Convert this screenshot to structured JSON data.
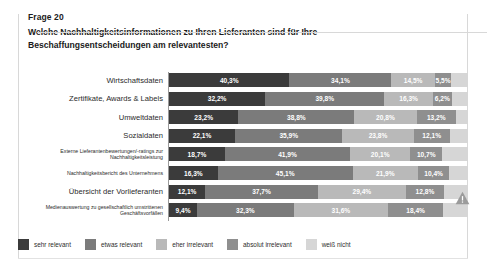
{
  "header": {
    "question_number": "Frage 20",
    "question_text": "Welche Nachhaltigkeitsinformationen zu Ihren Lieferanten sind für Ihre Beschaffungsentscheidungen am relevantesten?"
  },
  "icons": {
    "warning": "warning-triangle-icon"
  },
  "colors": {
    "sehr_relevant": "#3b3b3b",
    "etwas_relevant": "#7b7b7b",
    "eher_irrelevant": "#b9b9b9",
    "absolut_irrelevant": "#8f8f8f",
    "weiss_nicht": "#d6d6d6",
    "axis": "#9a9a9a",
    "border": "#d8d8d8"
  },
  "chart_data": {
    "type": "bar",
    "subtype": "stacked-horizontal-100",
    "title": "Welche Nachhaltigkeitsinformationen zu Ihren Lieferanten sind für Ihre Beschaffungsentscheidungen am relevantesten?",
    "xlabel": "",
    "ylabel": "",
    "xlim": [
      0,
      100
    ],
    "grid": false,
    "legend_position": "bottom",
    "legend": [
      "sehr relevant",
      "etwas relevant",
      "eher irrelevant",
      "absolut irrelevant",
      "weiß nicht"
    ],
    "categories": [
      "Wirtschaftsdaten",
      "Zertifikate, Awards & Labels",
      "Umweltdaten",
      "Sozialdaten",
      "Externe Lieferantenbewertungen/-ratings zur Nachhaltigkeitsleistung",
      "Nachhaltigkeitsbericht des Unternehmens",
      "Übersicht der Vorlieferanten",
      "Medienauswertung zu gesellschaftlich umstrittenen Geschäftsvorfällen"
    ],
    "series": [
      {
        "name": "sehr relevant",
        "values": [
          40.3,
          32.2,
          23.2,
          22.1,
          18.7,
          16.3,
          12.1,
          9.4
        ]
      },
      {
        "name": "etwas relevant",
        "values": [
          34.1,
          39.8,
          38.8,
          35.9,
          41.9,
          45.1,
          37.7,
          32.3
        ]
      },
      {
        "name": "eher irrelevant",
        "values": [
          14.5,
          16.3,
          20.8,
          23.8,
          20.1,
          21.9,
          29.4,
          31.6
        ]
      },
      {
        "name": "absolut irrelevant",
        "values": [
          5.5,
          6.2,
          13.2,
          12.1,
          10.7,
          10.4,
          12.8,
          18.4
        ]
      },
      {
        "name": "weiß nicht",
        "values": [
          5.6,
          5.5,
          4.0,
          6.1,
          8.6,
          6.3,
          8.0,
          8.3
        ]
      }
    ],
    "value_labels": [
      [
        "40,3%",
        "34,1%",
        "14,5%",
        "5,5%",
        ""
      ],
      [
        "32,2%",
        "39,8%",
        "16,3%",
        "6,2%",
        ""
      ],
      [
        "23,2%",
        "38,8%",
        "20,8%",
        "13,2%",
        ""
      ],
      [
        "22,1%",
        "35,9%",
        "23,8%",
        "12,1%",
        ""
      ],
      [
        "18,7%",
        "41,9%",
        "20,1%",
        "10,7%",
        ""
      ],
      [
        "16,3%",
        "45,1%",
        "21,9%",
        "10,4%",
        ""
      ],
      [
        "12,1%",
        "37,7%",
        "29,4%",
        "12,8%",
        ""
      ],
      [
        "9,4%",
        "32,3%",
        "31,6%",
        "18,4%",
        ""
      ]
    ],
    "annotations": [
      {
        "row": "Übersicht der Vorlieferanten",
        "icon": "warning-triangle-icon"
      }
    ]
  },
  "rows": [
    {
      "label": "Wirtschaftsdaten",
      "size": "big"
    },
    {
      "label": "Zertifikate, Awards & Labels",
      "size": "big"
    },
    {
      "label": "Umweltdaten",
      "size": "big"
    },
    {
      "label": "Sozialdaten",
      "size": "big"
    },
    {
      "label": "Externe Lieferantenbewertungen/-ratings zur Nachhaltigkeitsleistung",
      "size": "small"
    },
    {
      "label": "Nachhaltigkeitsbericht des Unternehmens",
      "size": "small"
    },
    {
      "label": "Übersicht der Vorlieferanten",
      "size": "big"
    },
    {
      "label": "Medienauswertung zu gesellschaftlich umstrittenen Geschäftsvorfällen",
      "size": "small"
    }
  ],
  "legend": [
    {
      "label": "sehr relevant",
      "color": "#3b3b3b"
    },
    {
      "label": "etwas relevant",
      "color": "#7b7b7b"
    },
    {
      "label": "eher irrelevant",
      "color": "#b9b9b9"
    },
    {
      "label": "absolut irrelevant",
      "color": "#8f8f8f"
    },
    {
      "label": "weiß nicht",
      "color": "#d6d6d6"
    }
  ]
}
